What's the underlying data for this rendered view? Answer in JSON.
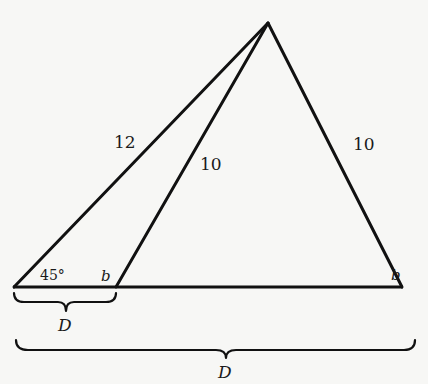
{
  "diagram": {
    "colors": {
      "background": "#f7f7f5",
      "stroke": "#111111",
      "text": "#1a1a1a"
    },
    "vertices": {
      "apex": {
        "x": 268,
        "y": 23
      },
      "left": {
        "x": 14,
        "y": 287
      },
      "middle": {
        "x": 116,
        "y": 287
      },
      "right": {
        "x": 402,
        "y": 287
      }
    },
    "labels": {
      "left_side": "12",
      "inner_side": "10",
      "right_side": "10",
      "left_angle": "45°",
      "middle_angle": "b",
      "right_angle": "b",
      "small_brace": "D",
      "large_brace": "D"
    }
  }
}
